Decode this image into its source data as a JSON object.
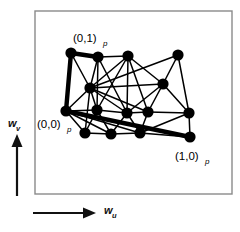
{
  "figure": {
    "type": "graph-embedding-plot",
    "background_color": "#ffffff",
    "frame": {
      "name": "plot-frame",
      "x": 35,
      "y": 11,
      "width": 197,
      "height": 183,
      "stroke_color": "#8a8a8a",
      "stroke_width": 1.4
    },
    "axes": {
      "v_axis": {
        "label": "w",
        "subscript": "v",
        "direction": "up",
        "arrow": {
          "x": 17,
          "y_start": 196,
          "y_end": 134
        },
        "label_pos": {
          "x": 8,
          "y": 127
        },
        "sub_pos": {
          "x": 16,
          "y": 131
        }
      },
      "u_axis": {
        "label": "w",
        "subscript": "u",
        "direction": "right",
        "arrow": {
          "y": 213,
          "x_start": 33,
          "x_end": 96
        },
        "label_pos": {
          "x": 104,
          "y": 214
        },
        "sub_pos": {
          "x": 112,
          "y": 218
        }
      }
    },
    "corner_labels": [
      {
        "name": "label-0-1",
        "text": "(0,1)",
        "subscript": "p",
        "x": 73,
        "y": 42,
        "sub_x": 103,
        "sub_y": 46,
        "anchor_node": 0
      },
      {
        "name": "label-0-0",
        "text": "(0,0)",
        "subscript": "p",
        "x": 37,
        "y": 128,
        "sub_x": 67,
        "sub_y": 132,
        "anchor_node": 6
      },
      {
        "name": "label-1-0",
        "text": "(1,0)",
        "subscript": "p",
        "x": 175,
        "y": 160,
        "sub_x": 205,
        "sub_y": 164,
        "anchor_node": 15
      }
    ],
    "graph": {
      "node_color": "#000000",
      "node_radius": 5.6,
      "edge_color": "#000000",
      "edge_width": 1.5,
      "thick_edge_width": 4.4,
      "nodes": [
        {
          "id": 0,
          "name": "node-corner-0-1",
          "x": 71,
          "y": 53
        },
        {
          "id": 1,
          "name": "node-1",
          "x": 98,
          "y": 57
        },
        {
          "id": 2,
          "name": "node-2",
          "x": 128,
          "y": 56
        },
        {
          "id": 3,
          "name": "node-3",
          "x": 178,
          "y": 55
        },
        {
          "id": 4,
          "name": "node-4",
          "x": 90,
          "y": 88
        },
        {
          "id": 5,
          "name": "node-5",
          "x": 163,
          "y": 84
        },
        {
          "id": 6,
          "name": "node-corner-0-0",
          "x": 66,
          "y": 111
        },
        {
          "id": 7,
          "name": "node-7",
          "x": 97,
          "y": 110
        },
        {
          "id": 8,
          "name": "node-8",
          "x": 127,
          "y": 113
        },
        {
          "id": 9,
          "name": "node-9",
          "x": 148,
          "y": 112
        },
        {
          "id": 10,
          "name": "node-10",
          "x": 189,
          "y": 113
        },
        {
          "id": 11,
          "name": "node-11",
          "x": 85,
          "y": 133
        },
        {
          "id": 12,
          "name": "node-12",
          "x": 111,
          "y": 134
        },
        {
          "id": 13,
          "name": "node-13",
          "x": 140,
          "y": 133
        },
        {
          "id": 15,
          "name": "node-corner-1-0",
          "x": 190,
          "y": 137
        }
      ],
      "edges": [
        {
          "from": 0,
          "to": 1,
          "thick": true
        },
        {
          "from": 0,
          "to": 6,
          "thick": true
        },
        {
          "from": 6,
          "to": 15,
          "thick": true
        },
        {
          "from": 1,
          "to": 4
        },
        {
          "from": 1,
          "to": 7
        },
        {
          "from": 1,
          "to": 8
        },
        {
          "from": 2,
          "to": 4
        },
        {
          "from": 2,
          "to": 5
        },
        {
          "from": 2,
          "to": 7
        },
        {
          "from": 2,
          "to": 8
        },
        {
          "from": 2,
          "to": 9
        },
        {
          "from": 3,
          "to": 5
        },
        {
          "from": 3,
          "to": 4
        },
        {
          "from": 3,
          "to": 10
        },
        {
          "from": 4,
          "to": 5
        },
        {
          "from": 4,
          "to": 6
        },
        {
          "from": 4,
          "to": 7
        },
        {
          "from": 4,
          "to": 8
        },
        {
          "from": 4,
          "to": 9
        },
        {
          "from": 5,
          "to": 8
        },
        {
          "from": 5,
          "to": 9
        },
        {
          "from": 5,
          "to": 10
        },
        {
          "from": 6,
          "to": 7
        },
        {
          "from": 6,
          "to": 11
        },
        {
          "from": 6,
          "to": 12
        },
        {
          "from": 7,
          "to": 11
        },
        {
          "from": 7,
          "to": 12
        },
        {
          "from": 7,
          "to": 8
        },
        {
          "from": 8,
          "to": 12
        },
        {
          "from": 8,
          "to": 13
        },
        {
          "from": 8,
          "to": 9
        },
        {
          "from": 9,
          "to": 13
        },
        {
          "from": 9,
          "to": 10
        },
        {
          "from": 10,
          "to": 15
        },
        {
          "from": 10,
          "to": 13
        },
        {
          "from": 11,
          "to": 12
        },
        {
          "from": 12,
          "to": 13
        },
        {
          "from": 13,
          "to": 15
        },
        {
          "from": 0,
          "to": 4
        },
        {
          "from": 1,
          "to": 2
        },
        {
          "from": 6,
          "to": 13
        },
        {
          "from": 11,
          "to": 4
        }
      ]
    }
  }
}
